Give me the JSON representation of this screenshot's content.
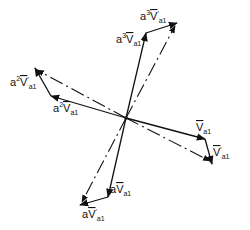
{
  "diagram": {
    "type": "phasor-diagram",
    "origin_label": "",
    "phasors": [
      {
        "id": "va1",
        "coef": "",
        "prime": false,
        "symbol": "V",
        "subscript": "a1",
        "style": "solid"
      },
      {
        "id": "va1p",
        "coef": "",
        "prime": true,
        "symbol": "V",
        "subscript": "a1",
        "style": "solid"
      },
      {
        "id": "a_va1",
        "coef": "a",
        "prime": false,
        "symbol": "V",
        "subscript": "a1",
        "style": "solid"
      },
      {
        "id": "a_va1p",
        "coef": "a",
        "prime": true,
        "symbol": "V",
        "subscript": "a1",
        "style": "solid"
      },
      {
        "id": "a2_va1",
        "coef": "a",
        "coef_power": "2",
        "prime": false,
        "symbol": "V",
        "subscript": "a1",
        "style": "solid"
      },
      {
        "id": "a2_va1p",
        "coef": "a",
        "coef_power": "2",
        "prime": true,
        "symbol": "V",
        "subscript": "a1",
        "style": "solid"
      },
      {
        "id": "a3_va1",
        "coef": "a",
        "coef_power": "3",
        "prime": false,
        "symbol": "V",
        "subscript": "a1",
        "style": "solid"
      },
      {
        "id": "a3_va1p",
        "coef": "a",
        "coef_power": "3",
        "prime": true,
        "symbol": "V",
        "subscript": "a1",
        "style": "solid"
      }
    ],
    "labels": {
      "va1": {
        "coef": "",
        "power": "",
        "symbol": "V",
        "prime": "",
        "sub": "a1"
      },
      "va1p": {
        "coef": "",
        "power": "",
        "symbol": "V",
        "prime": "′",
        "sub": "a1"
      },
      "a_va1": {
        "coef": "a",
        "power": "",
        "symbol": "V",
        "prime": "",
        "sub": "a1"
      },
      "a_va1p": {
        "coef": "a",
        "power": "",
        "symbol": "V",
        "prime": "′",
        "sub": "a1"
      },
      "a2_va1": {
        "coef": "a",
        "power": "2",
        "symbol": "V",
        "prime": "",
        "sub": "a1"
      },
      "a2_va1p": {
        "coef": "a",
        "power": "2",
        "symbol": "V",
        "prime": "′",
        "sub": "a1"
      },
      "a3_va1": {
        "coef": "a",
        "power": "3",
        "symbol": "V",
        "prime": "",
        "sub": "a1"
      },
      "a3_va1p": {
        "coef": "a",
        "power": "3",
        "symbol": "V",
        "prime": "′",
        "sub": "a1"
      }
    }
  }
}
